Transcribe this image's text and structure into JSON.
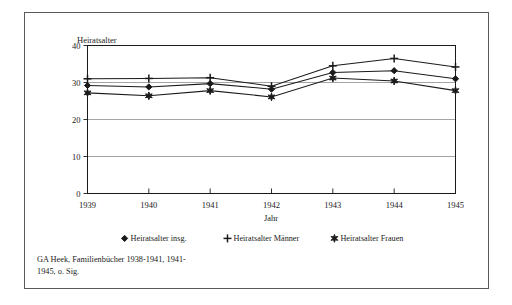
{
  "figure": {
    "source_note_line1": "GA Heek, Familienbücher 1938-1941, 1941-",
    "source_note_line2": "1945, o. Sig."
  },
  "chart_data": {
    "type": "line",
    "title": "",
    "xlabel": "Jahr",
    "ylabel": "Heiratsalter",
    "categories": [
      "1939",
      "1940",
      "1941",
      "1942",
      "1943",
      "1944",
      "1945"
    ],
    "x": [
      1939,
      1940,
      1941,
      1942,
      1943,
      1944,
      1945
    ],
    "ylim": [
      0,
      40
    ],
    "yticks": [
      "0",
      "10",
      "20",
      "30",
      "40"
    ],
    "ytick_values": [
      0,
      10,
      20,
      30,
      40
    ],
    "grid": true,
    "legend_position": "bottom",
    "series": [
      {
        "name": "Heiratsalter insg.",
        "marker": "diamond",
        "values": [
          29.2,
          28.8,
          29.7,
          28.2,
          32.7,
          33.2,
          31.0
        ]
      },
      {
        "name": "Heiratsalter Männer",
        "marker": "plus",
        "values": [
          31.0,
          31.1,
          31.3,
          29.0,
          34.5,
          36.5,
          34.2
        ]
      },
      {
        "name": "Heiratsalter Frauen",
        "marker": "star",
        "values": [
          27.2,
          26.4,
          27.8,
          26.1,
          31.2,
          30.4,
          27.8
        ]
      }
    ]
  },
  "colors": {
    "ink": "#1a1a1a",
    "grid": "#8d8d8d",
    "frame": "#5a5a5a",
    "background": "#ffffff"
  }
}
